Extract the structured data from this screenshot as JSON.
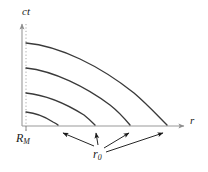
{
  "figure": {
    "name": "spacetime-diagram",
    "background_color": "#ffffff",
    "axis_color": "#9a9a9a",
    "curve_color": "#3a3a3a",
    "arrow_color": "#1a1a1a",
    "label_color": "#1a1a1a"
  },
  "axes": {
    "vertical": {
      "label": "ct",
      "name": "vertical-axis",
      "has_arrow": true,
      "x": 22,
      "y_top": 22,
      "y_bottom": 126
    },
    "horizontal": {
      "label": "r",
      "name": "horizontal-axis",
      "has_arrow": true,
      "y": 126,
      "x_left": 22,
      "x_right": 186
    }
  },
  "guides": {
    "dotted_line": {
      "label": "R_M",
      "label_base": "R",
      "label_sub": "M",
      "name": "dotted-guide-line",
      "x": 26,
      "y_top": 22,
      "y_bottom": 130,
      "style": "dotted"
    }
  },
  "annotation": {
    "r0": {
      "label_base": "r",
      "label_sub": "0",
      "name": "r0-annotation",
      "x": 93,
      "y": 148,
      "arrow_count": 4,
      "arrow_targets": [
        58,
        95,
        130,
        168
      ]
    }
  },
  "chart_data": {
    "type": "line",
    "title": "",
    "xlabel": "r",
    "ylabel": "ct",
    "grid": false,
    "legend": null,
    "xlim": [
      22,
      186
    ],
    "ylim": [
      126,
      22
    ],
    "x_tick_labels": [
      "R_M"
    ],
    "y_tick_labels": [],
    "annotations": [
      {
        "text": "r_0",
        "points_to": "curve endpoints on r axis"
      }
    ],
    "series": [
      {
        "name": "curve-1",
        "start": {
          "x": 26,
          "y": 43
        },
        "end": {
          "x": 167,
          "y": 125
        },
        "path": "M26,43 C60,46 100,66 134,93 C148,105 158,116 167,125"
      },
      {
        "name": "curve-2",
        "start": {
          "x": 26,
          "y": 68
        },
        "end": {
          "x": 130,
          "y": 125
        },
        "path": "M26,68 C54,71 86,87 110,105 C119,112 125,119 130,125"
      },
      {
        "name": "curve-3",
        "start": {
          "x": 26,
          "y": 93
        },
        "end": {
          "x": 95,
          "y": 125
        },
        "path": "M26,93 C46,95 68,105 84,115 C89,119 92,122 95,125"
      },
      {
        "name": "curve-4",
        "start": {
          "x": 26,
          "y": 112
        },
        "end": {
          "x": 58,
          "y": 125
        },
        "path": "M26,112 C36,113 47,118 53,122 C55,123 57,124 58,125"
      }
    ]
  }
}
